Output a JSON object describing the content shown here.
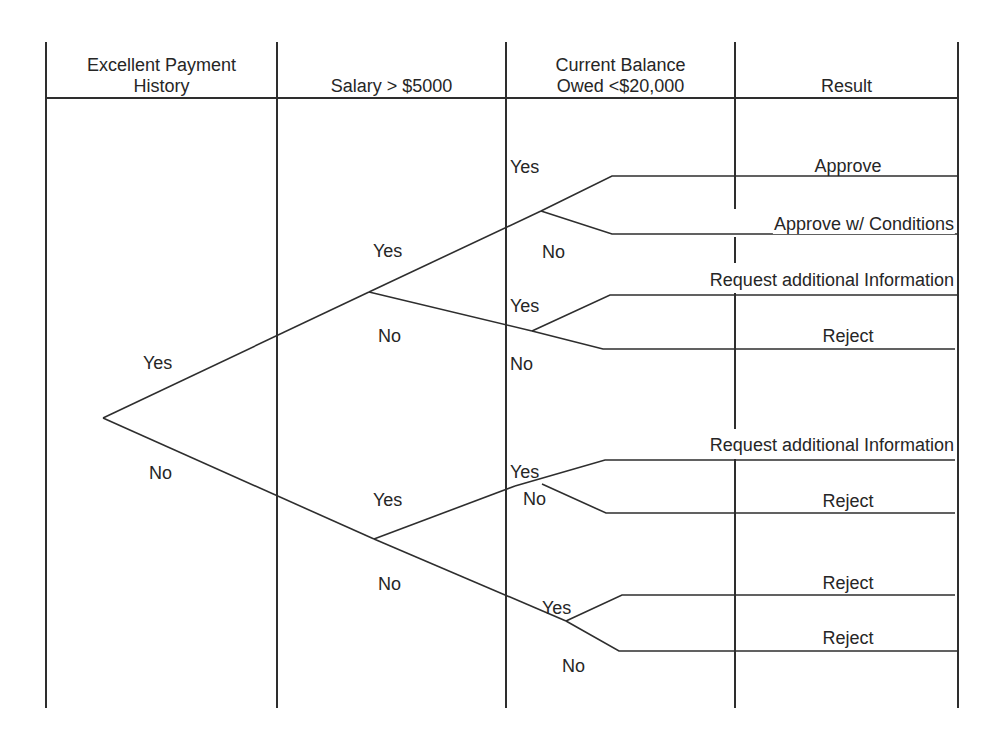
{
  "colors": {
    "line": "#2e2e2e",
    "text": "#262626",
    "background": "#ffffff"
  },
  "columns": [
    {
      "label_line1": "Excellent Payment",
      "label_line2": "History"
    },
    {
      "label_line1": "",
      "label_line2": "Salary > $5000"
    },
    {
      "label_line1": "Current Balance",
      "label_line2": "Owed <$20,000"
    },
    {
      "label_line1": "",
      "label_line2": "Result"
    }
  ],
  "branch_labels": {
    "root_yes": "Yes",
    "root_no": "No",
    "salary_top_yes": "Yes",
    "salary_top_no": "No",
    "salary_bottom_yes": "Yes",
    "salary_bottom_no": "No",
    "balance_1_yes": "Yes",
    "balance_1_no": "No",
    "balance_2_yes": "Yes",
    "balance_2_no": "No",
    "balance_3_yes": "Yes",
    "balance_3_no": "No",
    "balance_4_yes": "Yes",
    "balance_4_no": "No"
  },
  "results": [
    {
      "path": "Yes / Yes / Yes",
      "label": "Approve"
    },
    {
      "path": "Yes / Yes / No",
      "label": "Approve w/ Conditions"
    },
    {
      "path": "Yes / No / Yes",
      "label": "Request additional Information"
    },
    {
      "path": "Yes / No / No",
      "label": "Reject"
    },
    {
      "path": "No / Yes / Yes",
      "label": "Request additional Information"
    },
    {
      "path": "No / Yes / No",
      "label": "Reject"
    },
    {
      "path": "No / No / Yes",
      "label": "Reject"
    },
    {
      "path": "No / No / No",
      "label": "Reject"
    }
  ]
}
